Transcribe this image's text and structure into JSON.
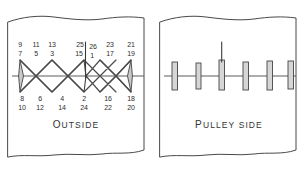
{
  "figure": {
    "panels": [
      {
        "id": "outside",
        "caption": "OUTSIDE",
        "caption_head": "O",
        "caption_rest": "UTSIDE",
        "pattern": "diamond-zigzag-lacing",
        "numbers_top": [
          {
            "upper": "9",
            "lower": "7"
          },
          {
            "upper": "11",
            "lower": "5"
          },
          {
            "upper": "13",
            "lower": "3"
          },
          {
            "upper": "25",
            "lower": "15"
          },
          {
            "upper": "26",
            "lower": "1"
          },
          {
            "upper": "23",
            "lower": "17"
          },
          {
            "upper": "21",
            "lower": "19"
          }
        ],
        "numbers_bottom": [
          {
            "upper": "8",
            "lower": "10"
          },
          {
            "upper": "6",
            "lower": "12"
          },
          {
            "upper": "4",
            "lower": "14"
          },
          {
            "upper": "2",
            "lower": "24"
          },
          {
            "upper": "16",
            "lower": "22"
          },
          {
            "upper": "18",
            "lower": "20"
          }
        ]
      },
      {
        "id": "pulley-side",
        "caption": "PULLEY SIDE",
        "caption_head": "P",
        "caption_rest": "ULLEY  S",
        "caption_tail": "IDE",
        "pattern": "vertical-staples",
        "staple_count": 6
      }
    ],
    "colors": {
      "ink": "#494949",
      "ink_dark": "#3a3a3a",
      "lace": "#4a4a4a",
      "bar_fill": "#d6d6d6",
      "paper": "#ffffff",
      "text": "#2e2e2e"
    }
  }
}
